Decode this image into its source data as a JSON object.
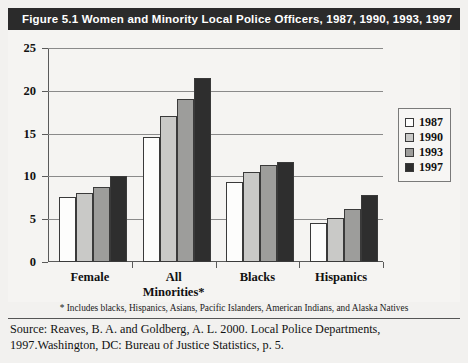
{
  "figure": {
    "title": "Figure 5.1  Women and Minority Local Police Officers, 1987, 1990, 1993, 1997",
    "footnote": "* Includes blacks, Hispanics, Asians, Pacific Islanders, American Indians, and Alaska Natives",
    "source_line1": "Source: Reaves, B. A. and Goldberg, A. L. 2000. Local Police Departments,",
    "source_line2": "1997.Washington, DC: Bureau of Justice Statistics, p. 5."
  },
  "chart_data": {
    "type": "bar",
    "title": "Figure 5.1  Women and Minority Local Police Officers, 1987, 1990, 1993, 1997",
    "xlabel": "",
    "ylabel": "",
    "ylim": [
      0,
      25
    ],
    "yticks": [
      "0",
      "5",
      "10",
      "15",
      "20",
      "25"
    ],
    "grid": true,
    "legend_position": "right",
    "categories": [
      "Female",
      "All Minorities*",
      "Blacks",
      "Hispanics"
    ],
    "series": [
      {
        "name": "1987",
        "color": "#fdfdfc",
        "values": [
          7.6,
          14.6,
          9.3,
          4.5
        ]
      },
      {
        "name": "1990",
        "color": "#c9c9c7",
        "values": [
          8.1,
          17.0,
          10.5,
          5.2
        ]
      },
      {
        "name": "1993",
        "color": "#9d9d9b",
        "values": [
          8.8,
          19.1,
          11.3,
          6.2
        ]
      },
      {
        "name": "1997",
        "color": "#2e2e2e",
        "values": [
          10.0,
          21.5,
          11.7,
          7.8
        ]
      }
    ],
    "annotations": [
      "* Includes blacks, Hispanics, Asians, Pacific Islanders, American Indians, and Alaska Natives"
    ]
  }
}
